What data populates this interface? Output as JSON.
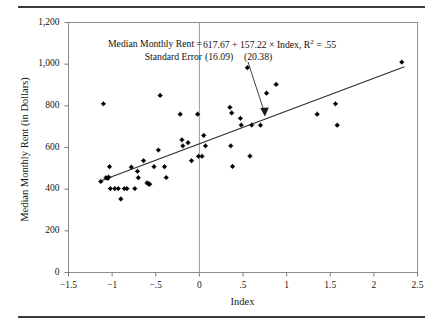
{
  "figure": {
    "background": "#ffffff",
    "rules": {
      "color": "#3b3b3b",
      "top_label": "top-rule",
      "bottom_label": "bottom-rule"
    }
  },
  "annotation": {
    "equation_label": "Median Monthly Rent =",
    "equation_body": "617.67 + 157.22 × Index, R",
    "r_squared_exp": "2",
    "r_squared_value": " = .55",
    "se_label": "Standard Error",
    "se_intercept": "(16.09)",
    "se_slope": "(20.38)"
  },
  "chart_data": {
    "type": "scatter",
    "title": "",
    "xlabel": "Index",
    "ylabel": "Median Monthly Rent (in Dollars)",
    "xlim": [
      -1.5,
      2.5
    ],
    "ylim": [
      0,
      1200
    ],
    "xticks": [
      -1.5,
      -1,
      -0.5,
      0,
      0.5,
      1,
      1.5,
      2,
      2.5
    ],
    "xticklabels": [
      "−1.5",
      "−1",
      "−.5",
      "0",
      ".5",
      "1",
      "1.5",
      "2",
      "2.5"
    ],
    "yticks": [
      0,
      200,
      400,
      600,
      800,
      1000,
      1200
    ],
    "yticklabels": [
      "0",
      "200",
      "400",
      "600",
      "800",
      "1,000",
      "1,200"
    ],
    "grid": false,
    "legend": "none",
    "marker_color": "#000000",
    "line_color": "#2b2b2b",
    "regression": {
      "intercept": 617.67,
      "slope": 157.22,
      "r_squared": 0.55,
      "se_intercept": 16.09,
      "se_slope": 20.38,
      "x_start": -1.15,
      "x_end": 2.35
    },
    "vertical_reference_line_x": 0,
    "points": [
      [
        -1.13,
        437
      ],
      [
        -1.1,
        810
      ],
      [
        -1.07,
        455
      ],
      [
        -1.05,
        452
      ],
      [
        -1.04,
        458
      ],
      [
        -1.03,
        508
      ],
      [
        -1.02,
        403
      ],
      [
        -0.97,
        403
      ],
      [
        -0.93,
        403
      ],
      [
        -0.9,
        353
      ],
      [
        -0.86,
        403
      ],
      [
        -0.83,
        403
      ],
      [
        -0.78,
        506
      ],
      [
        -0.74,
        403
      ],
      [
        -0.71,
        486
      ],
      [
        -0.7,
        455
      ],
      [
        -0.64,
        537
      ],
      [
        -0.6,
        430
      ],
      [
        -0.58,
        425
      ],
      [
        -0.57,
        424
      ],
      [
        -0.52,
        508
      ],
      [
        -0.47,
        588
      ],
      [
        -0.45,
        850
      ],
      [
        -0.4,
        508
      ],
      [
        -0.38,
        456
      ],
      [
        -0.22,
        760
      ],
      [
        -0.2,
        637
      ],
      [
        -0.19,
        608
      ],
      [
        -0.13,
        623
      ],
      [
        -0.09,
        537
      ],
      [
        -0.02,
        760
      ],
      [
        -0.01,
        558
      ],
      [
        0.03,
        558
      ],
      [
        0.05,
        658
      ],
      [
        0.07,
        608
      ],
      [
        0.35,
        793
      ],
      [
        0.36,
        608
      ],
      [
        0.37,
        766
      ],
      [
        0.38,
        509
      ],
      [
        0.47,
        740
      ],
      [
        0.48,
        708
      ],
      [
        0.55,
        983
      ],
      [
        0.58,
        559
      ],
      [
        0.6,
        708
      ],
      [
        0.7,
        707
      ],
      [
        0.77,
        861
      ],
      [
        0.88,
        903
      ],
      [
        1.35,
        760
      ],
      [
        1.56,
        810
      ],
      [
        1.58,
        707
      ],
      [
        2.32,
        1010
      ]
    ]
  }
}
